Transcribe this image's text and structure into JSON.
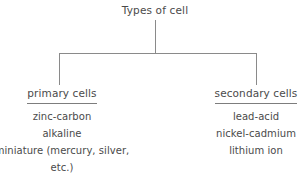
{
  "diagram": {
    "title": "Types of cell",
    "root": {
      "label": "Types of cell"
    },
    "branches": [
      {
        "id": "primary",
        "title": "primary cells",
        "underlined": true,
        "items": [
          "zinc-carbon",
          "alkaline",
          "miniature (mercury, silver, etc.)"
        ]
      },
      {
        "id": "secondary",
        "title": "secondary cells",
        "underlined": true,
        "items": [
          "lead-acid",
          "nickel-cadmium",
          "lithium ion"
        ]
      }
    ],
    "colors": {
      "background": "#ffffff",
      "text": "#4a4a4a",
      "line": "#8a8a8a",
      "underline": "#7d7d7d"
    }
  }
}
